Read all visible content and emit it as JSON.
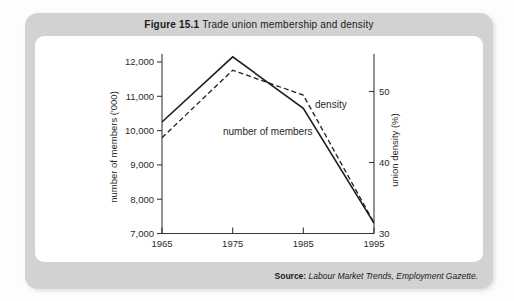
{
  "figure": {
    "label": "Figure 15.1",
    "title": " Trade union membership and density"
  },
  "source": {
    "label": "Source: ",
    "text": "Labour Market Trends, Employment Gazette."
  },
  "colors": {
    "frame": "#d2d2d2",
    "panel": "#ffffff",
    "axis": "#3a3a3a",
    "line": "#1f1f1f",
    "text": "#2a2a2a"
  },
  "chart_data": {
    "type": "line",
    "title": "Trade union membership and density",
    "x": [
      1965,
      1975,
      1985,
      1995
    ],
    "x_tick_labels": [
      "1965",
      "1975",
      "1985",
      "1995"
    ],
    "series": [
      {
        "name": "number of members",
        "axis": "left",
        "line_style": "solid",
        "values": [
          10250,
          12150,
          10650,
          7300
        ]
      },
      {
        "name": "density",
        "axis": "right",
        "line_style": "dashed",
        "values": [
          43.5,
          53,
          49.5,
          31.5
        ]
      }
    ],
    "left_axis": {
      "label": "number of members ('000)",
      "ticks": [
        7000,
        8000,
        9000,
        10000,
        11000,
        12000
      ],
      "tick_labels": [
        "7,000",
        "8,000",
        "9,000",
        "10,000",
        "11,000",
        "12,000"
      ],
      "range": [
        7000,
        12500
      ]
    },
    "right_axis": {
      "label": "union density (%)",
      "ticks": [
        30,
        40,
        50
      ],
      "tick_labels": [
        "30",
        "40",
        "50"
      ],
      "range": [
        30,
        55
      ]
    },
    "grid": false,
    "legend": "inline-labels"
  }
}
